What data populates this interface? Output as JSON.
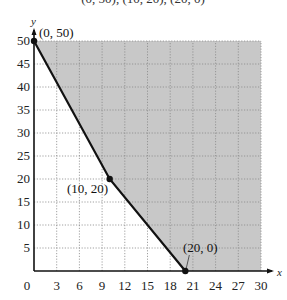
{
  "chart_data": {
    "type": "area",
    "title": "",
    "top_caption_fragment": "(0, 50), (10, 20), (20, 0)",
    "xlabel": "x",
    "ylabel": "y",
    "xlim": [
      0,
      30
    ],
    "ylim": [
      0,
      50
    ],
    "x_ticks": [
      0,
      3,
      6,
      9,
      12,
      15,
      18,
      21,
      24,
      27,
      30
    ],
    "y_ticks": [
      5,
      10,
      15,
      20,
      25,
      30,
      35,
      40,
      45,
      50
    ],
    "grid": true,
    "grid_style": "dotted",
    "boundary_line": {
      "points": [
        [
          0,
          50
        ],
        [
          10,
          20
        ],
        [
          20,
          0
        ]
      ],
      "style": "solid",
      "color": "#111111"
    },
    "shaded_region": {
      "description": "Feasible region above/right of boundary, within 0<=x<=30, 0<=y<=50",
      "color": "#c8c8c8"
    },
    "vertices": [
      {
        "x": 0,
        "y": 50,
        "label": "(0, 50)"
      },
      {
        "x": 10,
        "y": 20,
        "label": "(10, 20)"
      },
      {
        "x": 20,
        "y": 0,
        "label": "(20, 0)"
      }
    ]
  },
  "labels": {
    "caption": "(0, 50), (10, 20), (20, 0)",
    "x_axis": "x",
    "y_axis": "y",
    "origin": "0",
    "v1": "(0, 50)",
    "v2": "(10, 20)",
    "v3": "(20, 0)"
  }
}
